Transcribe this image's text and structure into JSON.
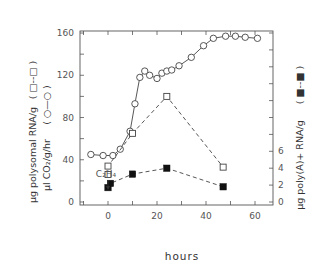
{
  "chart_data": {
    "type": "line",
    "title": "",
    "xlabel": "hours",
    "ylabel_left": "µg polysomal RNA/g (□--□)   µl CO2/g/hr (○—○)",
    "ylabel_right": "µg poly(A)+ RNA/g (■--■)",
    "xlim": [
      -12,
      68
    ],
    "ylim_left": [
      0,
      165
    ],
    "ylim_right": [
      0,
      20
    ],
    "x_ticks": [
      0,
      20,
      40,
      60
    ],
    "y_ticks_left": [
      0,
      40,
      80,
      120,
      160
    ],
    "y_ticks_right_labeled": [
      0,
      2,
      4,
      6
    ],
    "annotation": {
      "text": "C2H4",
      "x": 0,
      "arrow": "down"
    },
    "grid": false,
    "series": [
      {
        "name": "µl CO2/g/hr",
        "axis": "left",
        "marker": "open-circle",
        "line": "solid",
        "points": [
          [
            -7,
            45
          ],
          [
            -2,
            44
          ],
          [
            2,
            44
          ],
          [
            5,
            50
          ],
          [
            9,
            67
          ],
          [
            11,
            93
          ],
          [
            13,
            118
          ],
          [
            15,
            124
          ],
          [
            17,
            120
          ],
          [
            20,
            117
          ],
          [
            22,
            122
          ],
          [
            24,
            124
          ],
          [
            26,
            125
          ],
          [
            29,
            129
          ],
          [
            34,
            137
          ],
          [
            39,
            148
          ],
          [
            43,
            155
          ],
          [
            48,
            157
          ],
          [
            52,
            157
          ],
          [
            56,
            156
          ],
          [
            61,
            155
          ]
        ]
      },
      {
        "name": "µg polysomal RNA/g",
        "axis": "left",
        "marker": "open-square",
        "line": "dashed",
        "points": [
          [
            0,
            26
          ],
          [
            0,
            34
          ],
          [
            10,
            65
          ],
          [
            24,
            100
          ],
          [
            47,
            33
          ]
        ]
      },
      {
        "name": "µg poly(A)+ RNA/g",
        "axis": "right",
        "marker": "filled-square",
        "line": "dashed",
        "points": [
          [
            0,
            1.7
          ],
          [
            1,
            2.2
          ],
          [
            10,
            3.3
          ],
          [
            24,
            4.0
          ],
          [
            47,
            1.8
          ]
        ]
      }
    ]
  },
  "labels": {
    "xtitle": "hours",
    "ytitle_left_1": "µg polysomal RNA/g",
    "ytitle_left_1_legend": "( □--□ )",
    "ytitle_left_2": "µl CO₂/g/hr",
    "ytitle_left_2_legend": "( ○—○ )",
    "ytitle_right": "µg poly(A)+ RNA/g",
    "ytitle_right_legend": "( ■--■ )",
    "annotation": "C₂H₄",
    "x_ticks": [
      "0",
      "20",
      "40",
      "60"
    ],
    "y_left_ticks": [
      "0",
      "40",
      "80",
      "120",
      "160"
    ],
    "y_right_ticks": [
      "0",
      "2",
      "4",
      "6"
    ]
  }
}
